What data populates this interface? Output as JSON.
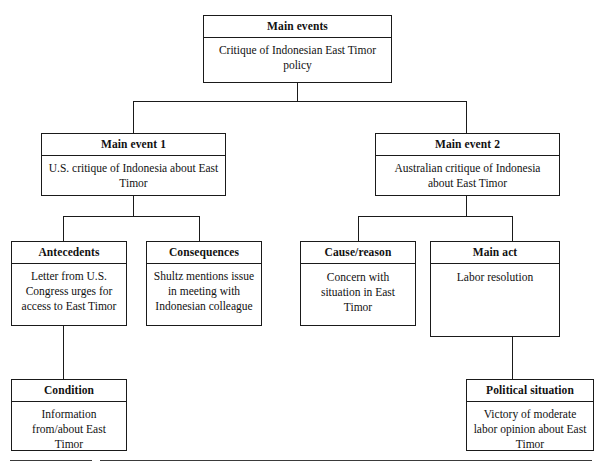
{
  "diagram": {
    "type": "hierarchical-tree",
    "title": "Main events",
    "nodes": {
      "main_events": {
        "header": "Main events",
        "body": "Critique of Indonesian East Timor policy"
      },
      "main_event_1": {
        "header": "Main event 1",
        "body": "U.S. critique of Indonesia about East Timor"
      },
      "main_event_2": {
        "header": "Main event 2",
        "body": "Australian critique of Indonesia about East Timor"
      },
      "antecedents": {
        "header": "Antecedents",
        "body": "Letter from U.S. Congress urges for access to East Timor"
      },
      "consequences": {
        "header": "Consequences",
        "body": "Shultz mentions issue in meeting with Indonesian colleague"
      },
      "cause_reason": {
        "header": "Cause/reason",
        "body": "Concern with situation in East Timor"
      },
      "main_act": {
        "header": "Main act",
        "body": "Labor resolution"
      },
      "condition": {
        "header": "Condition",
        "body": "Information from/about East Timor"
      },
      "political_situation": {
        "header": "Political situation",
        "body": "Victory of moderate labor opinion about East Timor"
      }
    },
    "edges": [
      {
        "from": "main_events",
        "to": "main_event_1"
      },
      {
        "from": "main_events",
        "to": "main_event_2"
      },
      {
        "from": "main_event_1",
        "to": "antecedents"
      },
      {
        "from": "main_event_1",
        "to": "consequences"
      },
      {
        "from": "main_event_2",
        "to": "cause_reason"
      },
      {
        "from": "main_event_2",
        "to": "main_act"
      },
      {
        "from": "antecedents",
        "to": "condition"
      },
      {
        "from": "main_act",
        "to": "political_situation"
      }
    ],
    "colors": {
      "line": "#1a1a1a",
      "background": "#ffffff",
      "text": "#111111"
    }
  }
}
